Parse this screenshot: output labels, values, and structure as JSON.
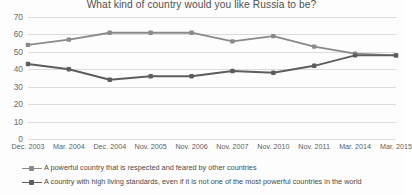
{
  "chart_data": {
    "type": "line",
    "title": "What kind of country would you like Russia to be?",
    "xlabel": "",
    "ylabel": "",
    "ylim": [
      0,
      70
    ],
    "y_ticks": [
      70,
      60,
      50,
      40,
      30,
      20,
      10,
      0
    ],
    "grid": true,
    "legend_position": "bottom",
    "categories": [
      "Dec. 2003",
      "Mar. 2004",
      "Dec. 2004",
      "Nov. 2005",
      "Nov. 2006",
      "Nov. 2007",
      "Nov. 2010",
      "Nov. 2011",
      "Mar. 2014",
      "Mar. 2015"
    ],
    "series": [
      {
        "name": "A powerful country that is respected and feared by other countries",
        "color": "#8a8a8a",
        "values": [
          54,
          57,
          61,
          61,
          61,
          56,
          59,
          53,
          49,
          48
        ]
      },
      {
        "name": "A country with high living standards, even if it is not one of the most powerful countries in the world",
        "color": "#5d5d5d",
        "values": [
          43,
          40,
          34,
          36,
          36,
          39,
          38,
          42,
          48,
          48
        ]
      }
    ]
  },
  "colors": {
    "series_1": "#8a8a8a",
    "series_2": "#5d5d5d",
    "grid": "#dcdcdc",
    "text": "#5a5a5a",
    "background": "#fdfdfd"
  }
}
